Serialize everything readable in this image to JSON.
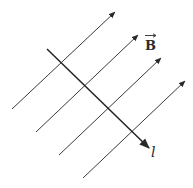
{
  "diagram": {
    "field_label": "B",
    "current_label": "l",
    "field_lines": [
      {
        "x1": 12,
        "y1": 109,
        "x2": 115,
        "y2": 12
      },
      {
        "x1": 36,
        "y1": 132,
        "x2": 138,
        "y2": 35
      },
      {
        "x1": 59,
        "y1": 155,
        "x2": 161,
        "y2": 58
      },
      {
        "x1": 83,
        "y1": 178,
        "x2": 185,
        "y2": 81
      }
    ],
    "wire": {
      "x1": 47,
      "y1": 49,
      "x2": 149,
      "y2": 148
    },
    "colors": {
      "field_line": "#3a3a3a",
      "wire": "#222222",
      "background": "#ffffff"
    }
  }
}
